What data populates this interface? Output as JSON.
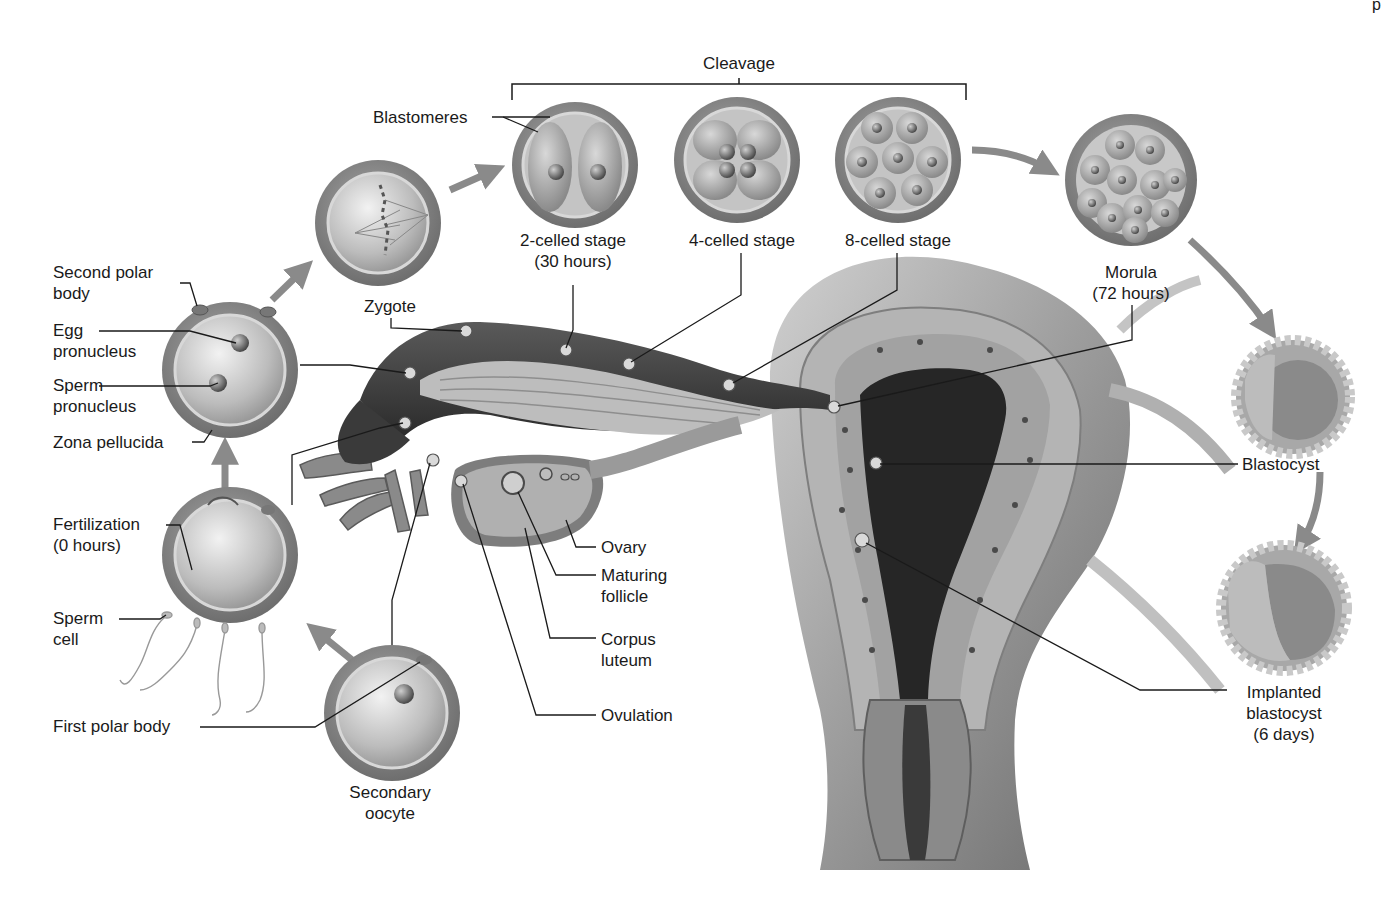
{
  "diagram": {
    "corner_fragment": "p",
    "colors": {
      "background": "#ffffff",
      "cell_outer": "#8c8c8c",
      "cell_inner": "#c9c9c9",
      "arrow": "#8a8a8a",
      "tissue_dark": "#2b2b2b",
      "tissue_mid": "#9a9a9a",
      "leader_line": "#1a1a1a"
    },
    "group_label": "Cleavage",
    "labels": {
      "second_polar_body": [
        "Second polar",
        "body"
      ],
      "egg_pronucleus": [
        "Egg",
        "pronucleus"
      ],
      "sperm_pronucleus": [
        "Sperm",
        "pronucleus"
      ],
      "zona_pellucida": [
        "Zona pellucida"
      ],
      "fertilization": [
        "Fertilization",
        "(0 hours)"
      ],
      "sperm_cell": [
        "Sperm",
        "cell"
      ],
      "first_polar_body": [
        "First polar body"
      ],
      "secondary_oocyte": [
        "Secondary",
        "oocyte"
      ],
      "zygote": [
        "Zygote"
      ],
      "blastomeres": [
        "Blastomeres"
      ],
      "two_celled": [
        "2-celled stage",
        "(30 hours)"
      ],
      "four_celled": [
        "4-celled stage"
      ],
      "eight_celled": [
        "8-celled stage"
      ],
      "morula": [
        "Morula",
        "(72 hours)"
      ],
      "blastocyst": [
        "Blastocyst"
      ],
      "implanted_blastocyst": [
        "Implanted",
        "blastocyst",
        "(6 days)"
      ],
      "ovary": [
        "Ovary"
      ],
      "maturing_follicle": [
        "Maturing",
        "follicle"
      ],
      "corpus_luteum": [
        "Corpus",
        "luteum"
      ],
      "ovulation": [
        "Ovulation"
      ]
    },
    "sequence": [
      "Secondary oocyte",
      "Fertilization (0 hours)",
      "Egg + sperm pronuclei",
      "Zygote",
      "2-celled stage (30 hours)",
      "4-celled stage",
      "8-celled stage",
      "Morula (72 hours)",
      "Blastocyst",
      "Implanted blastocyst (6 days)"
    ]
  }
}
